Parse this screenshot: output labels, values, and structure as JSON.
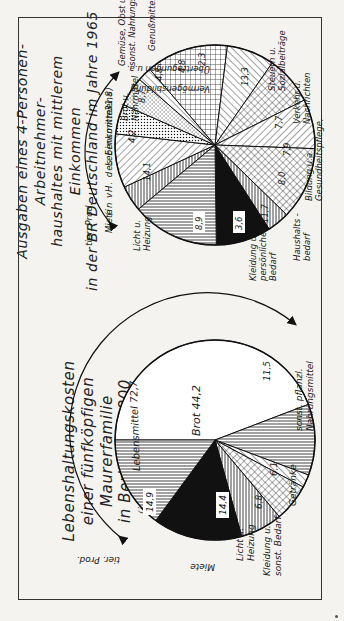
{
  "chart_data": [
    {
      "type": "pie",
      "title": "Lebenshaltungskosten einer fünfköpfigen Maurerfamilie in Berlin um 1800",
      "subtitle": "(in vH des Einkommens)",
      "group_label": "Lebensmittel 72,7",
      "categories": [
        "Brot",
        "sonst. pflanzl. Nahrungsmittel",
        "Getränke",
        "Kleidung u. sonst. Bedarf",
        "Licht u. Heizung",
        "Miete",
        "tier. Prod."
      ],
      "values": [
        44.2,
        11.5,
        2.1,
        6.1,
        6.8,
        14.4,
        14.9
      ],
      "value_labels": [
        "44,2",
        "11,5",
        "",
        "6,1",
        "6,8",
        "14,4",
        "14,9"
      ],
      "group_members": [
        "tier. Prod.",
        "Brot",
        "sonst. pflanzl. Nahrungsmittel",
        "Getränke"
      ],
      "group_total": 72.7
    },
    {
      "type": "pie",
      "title": "Ausgaben eines 4-Personen-Arbeitnehmerhaushaltes mit mittlerem Einkommen in der BR Deutschland im Jahre 1965",
      "subtitle": "(in vH. des Einkommens)",
      "group_label": "Lebensmittel 31,8",
      "categories": [
        "Brot u. Nährmittel",
        "Gemüse, Obst u. sonst. Nahrungsmittel",
        "Genußmittel",
        "Vermögensbildung",
        "Übertragungen u.a.",
        "Steuern u. Sozialbeiträge",
        "Verkehr u. Nachrichten",
        "Gesundheitspflege, Bildung u.a.",
        "Haushaltsbedarf",
        "Kleidung u. persönlicher Bedarf",
        "Licht u. Heizung",
        "Miete",
        "tier. Prod."
      ],
      "values": [
        4.2,
        8.7,
        4.8,
        4.8,
        2.3,
        13.3,
        7.7,
        7.9,
        8.0,
        11.7,
        3.6,
        8.9,
        14.1
      ],
      "value_labels": [
        "4,2",
        "8,7",
        "4,8",
        "4,8",
        "2,3",
        "13,3",
        "7,7",
        "7,9",
        "8,0",
        "11,7",
        "3,6",
        "8,9",
        "14,1"
      ],
      "group_members": [
        "tier. Prod.",
        "Brot u. Nährmittel",
        "Gemüse, Obst u. sonst. Nahrungsmittel"
      ],
      "group_total": 31.8
    }
  ],
  "left": {
    "title_line1": "Lebenshaltungskosten",
    "title_line2": "einer fünfköpfigen Maurerfamilie",
    "title_line3": "in Berlin um 1800",
    "subtitle": "(in vH des Einkommens)",
    "arc_label": "Lebensmittel 72,7",
    "labels": {
      "brot": "Brot  44,2",
      "sonst": [
        "sonst. pflanzl.",
        "Nahrungsmittel"
      ],
      "getraenke": "Getränke",
      "kleidung": [
        "Kleidung u.",
        "sonst. Bedarf"
      ],
      "licht": [
        "Licht u.",
        "Heizung"
      ],
      "miete": "Miete",
      "tier": "tier. Prod."
    },
    "values": {
      "sonst": "11,5",
      "kleidung": "6,1",
      "licht": "6,8",
      "miete": "14,4",
      "tier": "14,9"
    }
  },
  "right": {
    "title_line1": "Ausgaben eines 4-Personen-Arbeitnehmer-",
    "title_line2": "haushaltes  mit  mittlerem  Einkommen",
    "title_line3": "in der  BR Deutschland im Jahre 1965",
    "subtitle": "(in vH. des Einkommens)",
    "arc_label": "Lebensmittel",
    "arc_value": "31,8",
    "labels": {
      "brot": [
        "Brot u.",
        "Nährmittel"
      ],
      "gemuese": [
        "Gemüse, Obst u.",
        "sonst. Nahrungsmittel"
      ],
      "genuss": "Genußmittel",
      "vermoegen": "Vermögensbildung",
      "uebertrag": "Übertragungen u.a.",
      "steuern": [
        "Steuern u.",
        "Sozialbeiträge"
      ],
      "verkehr": [
        "Verkehr u.",
        "Nachrichten"
      ],
      "gesundheit": [
        "Gesundheitspflege,",
        "Bildung u.a."
      ],
      "haushalt": [
        "Haushalts -",
        "bedarf"
      ],
      "kleidung": [
        "Kleidung u.",
        "persönlicher",
        "Bedarf"
      ],
      "licht": [
        "Licht u.",
        "Heizung"
      ],
      "miete": "Miete",
      "tier": "tier. Prod."
    },
    "values": {
      "brot": "4,2",
      "gemuese": "8,7",
      "genuss": "4,8",
      "vermoegen": "4,8",
      "uebertrag": "2,3",
      "steuern": "13,3",
      "verkehr": "7,7",
      "gesundheit": "7,9",
      "haushalt": "8,0",
      "kleidung": "11,7",
      "licht": "3,6",
      "miete": "8,9",
      "tier": "14,1"
    }
  }
}
